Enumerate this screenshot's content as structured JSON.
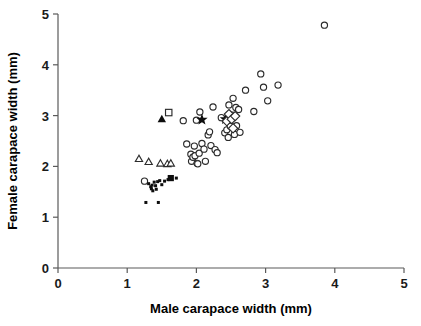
{
  "chart_data": {
    "type": "scatter",
    "title": "",
    "xlabel": "Male carapace width (mm)",
    "ylabel": "Female carapace width (mm)",
    "xlim": [
      0,
      5
    ],
    "ylim": [
      0,
      5
    ],
    "xticks": [
      "0",
      "1",
      "2",
      "3",
      "4",
      "5"
    ],
    "yticks": [
      "0",
      "1",
      "2",
      "3",
      "4",
      "5"
    ],
    "xtick_values": [
      0,
      1,
      2,
      3,
      4,
      5
    ],
    "ytick_values": [
      0,
      1,
      2,
      3,
      4,
      5
    ],
    "grid": false,
    "legend": "none",
    "series": [
      {
        "name": "open-circle",
        "marker": "open circle",
        "points": [
          [
            1.25,
            1.71
          ],
          [
            1.81,
            2.9
          ],
          [
            1.86,
            2.44
          ],
          [
            1.92,
            2.24
          ],
          [
            1.93,
            2.1
          ],
          [
            1.95,
            2.18
          ],
          [
            1.97,
            2.4
          ],
          [
            1.98,
            2.21
          ],
          [
            2.0,
            2.91
          ],
          [
            2.01,
            2.06
          ],
          [
            2.02,
            2.05
          ],
          [
            2.04,
            2.26
          ],
          [
            2.05,
            3.07
          ],
          [
            2.08,
            2.45
          ],
          [
            2.11,
            2.34
          ],
          [
            2.13,
            2.1
          ],
          [
            2.17,
            2.62
          ],
          [
            2.19,
            2.68
          ],
          [
            2.21,
            2.41
          ],
          [
            2.24,
            3.17
          ],
          [
            2.27,
            2.33
          ],
          [
            2.3,
            2.27
          ],
          [
            2.36,
            2.96
          ],
          [
            2.41,
            2.66
          ],
          [
            2.44,
            2.72
          ],
          [
            2.46,
            2.57
          ],
          [
            2.47,
            3.21
          ],
          [
            2.49,
            2.79
          ],
          [
            2.52,
            3.01
          ],
          [
            2.53,
            3.34
          ],
          [
            2.55,
            2.63
          ],
          [
            2.57,
            3.16
          ],
          [
            2.58,
            2.8
          ],
          [
            2.61,
            3.12
          ],
          [
            2.63,
            2.67
          ],
          [
            2.71,
            3.5
          ],
          [
            2.83,
            3.08
          ],
          [
            2.93,
            3.82
          ],
          [
            2.97,
            3.56
          ],
          [
            3.03,
            3.29
          ],
          [
            3.18,
            3.6
          ],
          [
            3.85,
            4.78
          ]
        ]
      },
      {
        "name": "open-triangle",
        "marker": "open triangle",
        "points": [
          [
            1.17,
            2.15
          ],
          [
            1.31,
            2.09
          ],
          [
            1.48,
            2.06
          ],
          [
            1.58,
            2.05
          ],
          [
            1.63,
            2.06
          ]
        ]
      },
      {
        "name": "small-filled-dot",
        "marker": "small filled dot",
        "points": [
          [
            1.27,
            1.29
          ],
          [
            1.31,
            1.66
          ],
          [
            1.34,
            1.6
          ],
          [
            1.35,
            1.56
          ],
          [
            1.36,
            1.63
          ],
          [
            1.37,
            1.52
          ],
          [
            1.39,
            1.69
          ],
          [
            1.41,
            1.62
          ],
          [
            1.42,
            1.55
          ],
          [
            1.44,
            1.7
          ],
          [
            1.45,
            1.29
          ],
          [
            1.47,
            1.72
          ],
          [
            1.5,
            1.64
          ],
          [
            1.54,
            1.71
          ],
          [
            1.59,
            1.74
          ],
          [
            1.71,
            1.77
          ]
        ]
      },
      {
        "name": "filled-square",
        "marker": "filled square",
        "points": [
          [
            1.63,
            1.77
          ]
        ]
      },
      {
        "name": "filled-triangle",
        "marker": "filled triangle",
        "points": [
          [
            1.5,
            2.93
          ]
        ]
      },
      {
        "name": "open-square",
        "marker": "open square",
        "points": [
          [
            1.6,
            3.06
          ]
        ]
      },
      {
        "name": "filled-star",
        "marker": "filled star",
        "points": [
          [
            2.08,
            2.92
          ],
          [
            2.42,
            2.93
          ]
        ]
      },
      {
        "name": "open-diamond",
        "marker": "open diamond",
        "points": [
          [
            2.44,
            2.89
          ],
          [
            2.47,
            3.03
          ],
          [
            2.51,
            2.93
          ],
          [
            2.53,
            2.75
          ],
          [
            2.56,
            2.99
          ]
        ]
      }
    ]
  }
}
